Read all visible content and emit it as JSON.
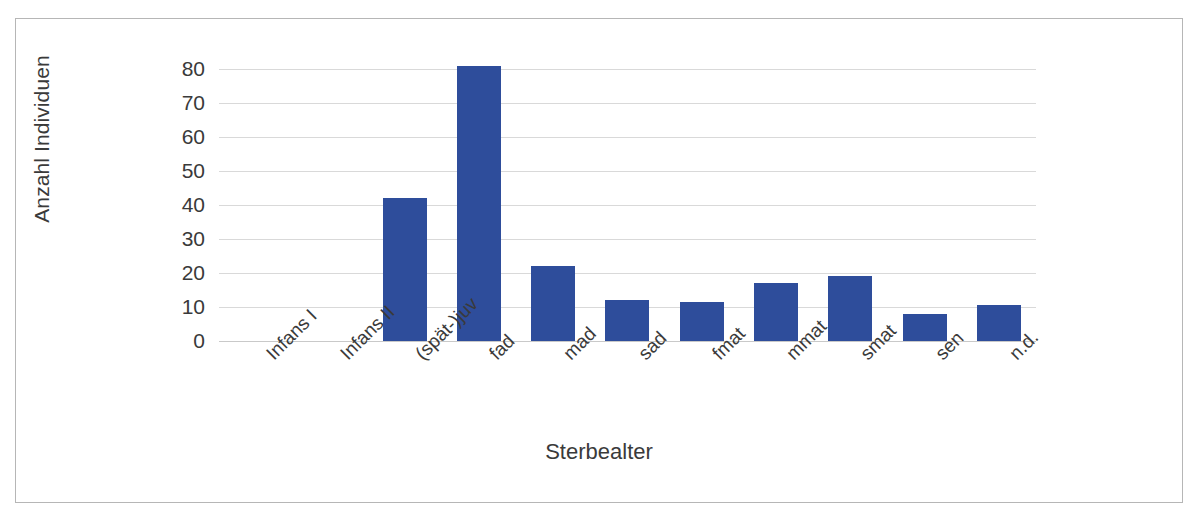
{
  "chart_data": {
    "type": "bar",
    "title": "",
    "xlabel": "Sterbealter",
    "ylabel": "Anzahl Individuen",
    "categories": [
      "Infans I",
      "Infans II",
      "(spät-)juv",
      "fad",
      "mad",
      "sad",
      "fmat",
      "mmat",
      "smat",
      "sen",
      "n.d."
    ],
    "values": [
      0,
      0,
      42,
      81,
      22,
      12,
      11.5,
      17,
      19,
      8,
      10.5
    ],
    "ylim": [
      0,
      80
    ],
    "yticks": [
      0,
      10,
      20,
      30,
      40,
      50,
      60,
      70,
      80
    ],
    "ytick_labels": [
      "0",
      "10",
      "20",
      "30",
      "40",
      "50",
      "60",
      "70",
      "80"
    ],
    "grid": true,
    "legend": false,
    "series_color": "#2e4d9b",
    "gridline_color": "#d9d9d9",
    "frame_color": "#b6b6b6"
  }
}
